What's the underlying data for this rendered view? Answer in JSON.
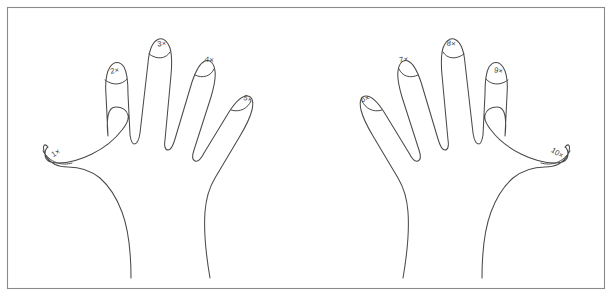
{
  "figure": {
    "background_color": "#ffffff",
    "frame": {
      "stroke_color": "#8a8a8a",
      "fill_color": "#ffffff",
      "x": 7,
      "y": 7,
      "width": 597,
      "height": 281
    },
    "line_color": "#4a4a4a",
    "label_color": "#3a3a3a"
  },
  "hands": [
    {
      "name": "left-hand",
      "side": "left",
      "fingertips": [
        {
          "id": "tip-1",
          "label": "1×",
          "finger": "thumb",
          "x": 57,
          "y": 155,
          "rotation": -32
        },
        {
          "id": "tip-2",
          "label": "2×",
          "finger": "index",
          "x": 115,
          "y": 73,
          "rotation": -10
        },
        {
          "id": "tip-3",
          "label": "3×",
          "finger": "middle",
          "x": 162,
          "y": 46,
          "rotation": -5
        },
        {
          "id": "tip-4",
          "label": "4×",
          "finger": "ring",
          "x": 209,
          "y": 62,
          "rotation": 8
        },
        {
          "id": "tip-5",
          "label": "5×",
          "finger": "little",
          "x": 247,
          "y": 101,
          "rotation": 20
        }
      ]
    },
    {
      "name": "right-hand",
      "side": "right",
      "fingertips": [
        {
          "id": "tip-6",
          "label": "6×",
          "finger": "little",
          "x": 366,
          "y": 101,
          "rotation": -20
        },
        {
          "id": "tip-7",
          "label": "7×",
          "finger": "ring",
          "x": 404,
          "y": 62,
          "rotation": -8
        },
        {
          "id": "tip-8",
          "label": "8×",
          "finger": "middle",
          "x": 451,
          "y": 46,
          "rotation": 5
        },
        {
          "id": "tip-9",
          "label": "9×",
          "finger": "index",
          "x": 498,
          "y": 73,
          "rotation": 10
        },
        {
          "id": "tip-10",
          "label": "10×",
          "finger": "thumb",
          "x": 556,
          "y": 155,
          "rotation": 32
        }
      ]
    }
  ]
}
